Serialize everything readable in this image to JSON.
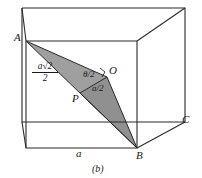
{
  "figure": {
    "caption": "(b)",
    "shape": "cube",
    "shading_color": "#9a9a9a",
    "line_color": "#2b2b2b",
    "background_color": "#ffffff",
    "vertices": [
      {
        "name": "A",
        "label": "A",
        "x": 26,
        "y": 41
      },
      {
        "name": "B",
        "label": "B",
        "x": 137,
        "y": 148
      },
      {
        "name": "C",
        "label": "C",
        "x": 178,
        "y": 122
      },
      {
        "name": "O",
        "label": "O",
        "x": 107,
        "y": 77
      },
      {
        "name": "P",
        "label": "P",
        "x": 80,
        "y": 93
      }
    ],
    "vertex_labels": {
      "A": "A",
      "B": "B",
      "C": "C",
      "O": "O",
      "P": "P"
    },
    "edge_labels": {
      "bottom_front": "a",
      "half_diagonal_numerator": "a√2",
      "half_diagonal_denominator": "2",
      "half_side": "a/2",
      "half_angle": "θ/2"
    },
    "annotations": [
      {
        "name": "half-face-diagonal-label",
        "text_numerator": "a√2",
        "text_denominator": "2",
        "x": 34,
        "y": 66
      },
      {
        "name": "half-angle-label",
        "text": "θ/2",
        "x": 84,
        "y": 72
      },
      {
        "name": "half-side-label",
        "text": "a/2",
        "x": 92,
        "y": 86
      },
      {
        "name": "bottom-edge-label",
        "text": "a",
        "x": 78,
        "y": 152
      }
    ]
  }
}
